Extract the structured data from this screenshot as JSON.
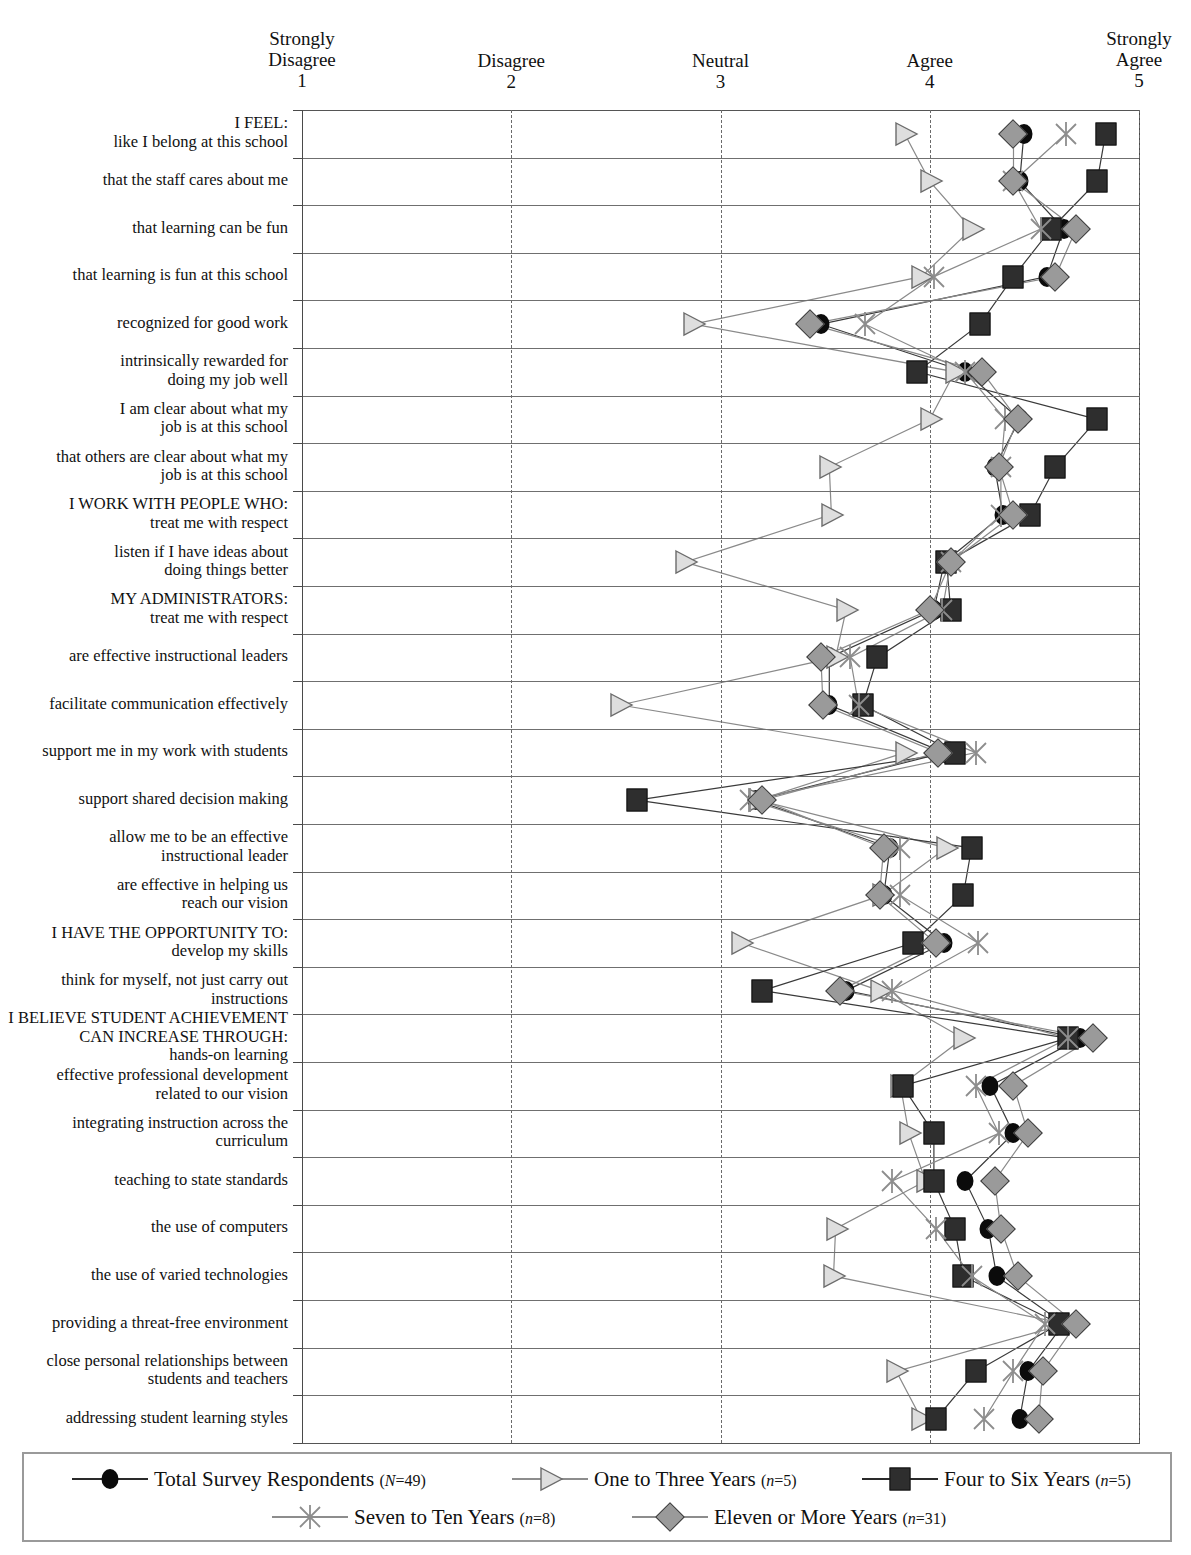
{
  "chart_data": {
    "type": "line",
    "title": "",
    "xlabel": "",
    "ylabel": "",
    "xlim": [
      1,
      5
    ],
    "grid": true,
    "legend_position": "bottom",
    "axis_ticks": [
      {
        "value": 1,
        "label": "Strongly\nDisagree",
        "num": "1"
      },
      {
        "value": 2,
        "label": "Disagree",
        "num": "2"
      },
      {
        "value": 3,
        "label": "Neutral",
        "num": "3"
      },
      {
        "value": 4,
        "label": "Agree",
        "num": "4"
      },
      {
        "value": 5,
        "label": "Strongly\nAgree",
        "num": "5"
      }
    ],
    "categories": [
      "I FEEL:\nlike I belong at this school",
      "that the staff cares about me",
      "that learning can be fun",
      "that learning is fun at this school",
      "recognized for good work",
      "intrinsically rewarded for\ndoing my job well",
      "I am clear about what my\njob is at this school",
      "that others are clear about what my\njob is at this school",
      "I WORK WITH PEOPLE WHO:\ntreat me with respect",
      "listen if I have ideas about\ndoing things better",
      "MY ADMINISTRATORS:\ntreat me with respect",
      "are effective instructional leaders",
      "facilitate communication effectively",
      "support me in my work with students",
      "support shared decision making",
      "allow me to be an effective\ninstructional leader",
      "are effective in helping us\nreach our vision",
      "I HAVE THE OPPORTUNITY TO:\ndevelop my skills",
      "think for myself, not just carry out\ninstructions",
      "I BELIEVE STUDENT ACHIEVEMENT\nCAN INCREASE THROUGH:\nhands-on learning",
      "effective professional development\nrelated to our vision",
      "integrating instruction across the\ncurriculum",
      "teaching to state standards",
      "the use of computers",
      "the use of varied technologies",
      "providing a threat-free environment",
      "close personal relationships between\nstudents and teachers",
      "addressing student learning styles"
    ],
    "series": [
      {
        "name": "Total Survey Respondents",
        "count_label": "(N=49)",
        "n": 49,
        "marker": "circle",
        "color": "#0b0b0b",
        "values": [
          4.45,
          4.43,
          4.64,
          4.56,
          3.48,
          4.17,
          4.43,
          4.31,
          4.35,
          4.07,
          4.02,
          3.52,
          3.52,
          4.07,
          3.17,
          3.81,
          3.78,
          4.07,
          3.6,
          4.72,
          4.29,
          4.4,
          4.17,
          4.28,
          4.32,
          4.64,
          4.47,
          4.43
        ]
      },
      {
        "name": "One to Three Years",
        "count_label": "(n=5)",
        "n": 5,
        "marker": "triangle",
        "color": "#dcdcdc",
        "values": [
          3.88,
          4.0,
          4.2,
          3.96,
          2.87,
          4.12,
          4.0,
          3.52,
          3.53,
          2.83,
          3.6,
          3.55,
          2.52,
          3.88,
          3.18,
          4.08,
          3.77,
          3.1,
          3.76,
          4.16,
          3.86,
          3.9,
          3.98,
          3.55,
          3.54,
          4.65,
          3.84,
          3.96
        ]
      },
      {
        "name": "Four to Six Years",
        "count_label": "(n=5)",
        "n": 5,
        "marker": "square",
        "color": "#2e2e2e",
        "values": [
          4.84,
          4.8,
          4.58,
          4.4,
          4.24,
          3.94,
          4.8,
          4.6,
          4.48,
          4.08,
          4.1,
          3.75,
          3.68,
          4.12,
          2.6,
          4.2,
          4.16,
          3.92,
          3.2,
          4.66,
          3.87,
          4.02,
          4.02,
          4.12,
          4.16,
          4.62,
          4.22,
          4.03
        ]
      },
      {
        "name": "Seven to Ten Years",
        "count_label": "(n=8)",
        "n": 8,
        "marker": "x",
        "color": "#9a9a9a",
        "values": [
          4.65,
          4.4,
          4.53,
          4.02,
          3.69,
          4.17,
          4.36,
          4.34,
          4.34,
          4.1,
          4.06,
          3.62,
          3.66,
          4.22,
          3.14,
          3.86,
          3.86,
          4.23,
          3.82,
          4.66,
          4.22,
          4.33,
          3.82,
          4.03,
          4.2,
          4.55,
          4.4,
          4.26
        ]
      },
      {
        "name": "Eleven or More Years",
        "count_label": "(n=31)",
        "n": 31,
        "marker": "diamond",
        "color": "#9a9a9a",
        "values": [
          4.4,
          4.4,
          4.7,
          4.6,
          3.43,
          4.25,
          4.42,
          4.33,
          4.4,
          4.1,
          4.0,
          3.48,
          3.49,
          4.04,
          3.2,
          3.78,
          3.76,
          4.03,
          3.57,
          4.78,
          4.4,
          4.47,
          4.31,
          4.34,
          4.42,
          4.7,
          4.54,
          4.52
        ]
      }
    ]
  },
  "legend": {
    "items": [
      {
        "label": "Total Survey Respondents",
        "count": "(N=49)",
        "marker": "circle"
      },
      {
        "label": "One to Three Years",
        "count": "(n=5)",
        "marker": "triangle"
      },
      {
        "label": "Four to Six Years",
        "count": "(n=5)",
        "marker": "square"
      },
      {
        "label": "Seven to Ten Years",
        "count": "(n=8)",
        "marker": "x"
      },
      {
        "label": "Eleven or More Years",
        "count": "(n=31)",
        "marker": "diamond"
      }
    ]
  }
}
